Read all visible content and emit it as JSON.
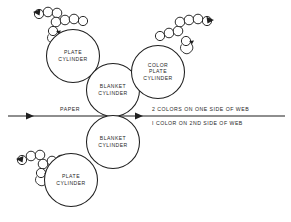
{
  "diagram": {
    "background_color": "#ffffff",
    "line_color": "#1f1f1f",
    "cylinders": [
      {
        "id": "upper-left-plate-cylinder",
        "lines": [
          "PLATE",
          "CYLINDER"
        ],
        "cx": 73,
        "cy": 56,
        "r": 26.5
      },
      {
        "id": "upper-blanket-cylinder",
        "lines": [
          "BLANKET",
          "CYLINDER"
        ],
        "cx": 113,
        "cy": 90,
        "r": 26.5
      },
      {
        "id": "color-plate-cylinder",
        "lines": [
          "COLOR",
          "PLATE",
          "CYLINDER"
        ],
        "cx": 158,
        "cy": 72,
        "r": 26.5
      },
      {
        "id": "lower-blanket-cylinder",
        "lines": [
          "BLANKET",
          "CYLINDER"
        ],
        "cx": 113,
        "cy": 142,
        "r": 26.5
      },
      {
        "id": "lower-left-plate-cylinder",
        "lines": [
          "PLATE",
          "CYLINDER"
        ],
        "cx": 71,
        "cy": 180,
        "r": 26.5
      }
    ],
    "web": {
      "paper_label": "PAPER",
      "line_y": 116,
      "left_x": 8,
      "right_x": 285,
      "left_arrow_x": 34,
      "right_arrow_x": 143
    },
    "notes": [
      {
        "id": "note-two-colors",
        "text": "2 COLORS ON ONE SIDE OF WEB",
        "x": 152,
        "y": 110
      },
      {
        "id": "note-one-color",
        "text": "I COLOR ON 2ND SIDE OF WEB",
        "x": 152,
        "y": 124
      }
    ],
    "roller_trains": [
      {
        "id": "upper-left-roller-train",
        "rollers": [
          {
            "cx": 39,
            "cy": 14,
            "r": 4.6
          },
          {
            "cx": 48,
            "cy": 12,
            "r": 4.8
          },
          {
            "cx": 57,
            "cy": 13,
            "r": 4.8
          },
          {
            "cx": 56,
            "cy": 22,
            "r": 4.8
          },
          {
            "cx": 65,
            "cy": 20,
            "r": 4.8
          },
          {
            "cx": 74,
            "cy": 19,
            "r": 4.8
          },
          {
            "cx": 83,
            "cy": 21,
            "r": 4.6
          },
          {
            "cx": 53,
            "cy": 31,
            "r": 4.6
          }
        ]
      },
      {
        "id": "upper-right-roller-train",
        "rollers": [
          {
            "cx": 160,
            "cy": 36,
            "r": 4.6
          },
          {
            "cx": 169,
            "cy": 33,
            "r": 4.8
          },
          {
            "cx": 178,
            "cy": 31,
            "r": 4.8
          },
          {
            "cx": 180,
            "cy": 22,
            "r": 4.8
          },
          {
            "cx": 189,
            "cy": 20,
            "r": 4.8
          },
          {
            "cx": 198,
            "cy": 19,
            "r": 4.8
          },
          {
            "cx": 207,
            "cy": 21,
            "r": 4.6
          },
          {
            "cx": 186,
            "cy": 41,
            "r": 4.6
          }
        ]
      },
      {
        "id": "lower-left-roller-train",
        "rollers": [
          {
            "cx": 22,
            "cy": 160,
            "r": 4.6
          },
          {
            "cx": 31,
            "cy": 156,
            "r": 4.8
          },
          {
            "cx": 40,
            "cy": 155,
            "r": 4.8
          },
          {
            "cx": 43,
            "cy": 164,
            "r": 4.8
          },
          {
            "cx": 52,
            "cy": 161,
            "r": 4.8
          },
          {
            "cx": 61,
            "cy": 160,
            "r": 4.8
          },
          {
            "cx": 41,
            "cy": 173,
            "r": 4.6
          }
        ]
      }
    ]
  }
}
